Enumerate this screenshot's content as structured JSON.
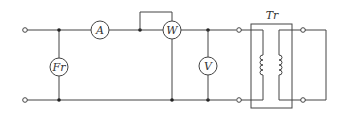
{
  "diagram": {
    "type": "electrical-circuit",
    "components": {
      "fr": {
        "label": "Fr",
        "name": "frequency meter"
      },
      "a": {
        "label": "A",
        "name": "ammeter"
      },
      "w": {
        "label": "W",
        "name": "wattmeter"
      },
      "v": {
        "label": "V",
        "name": "voltmeter"
      },
      "tr": {
        "label": "Tr",
        "name": "transformer"
      }
    },
    "colors": {
      "line": "#444444",
      "background": "#ffffff"
    }
  }
}
